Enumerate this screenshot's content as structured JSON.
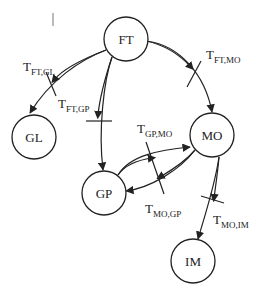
{
  "diagram": {
    "type": "directed-graph",
    "nodes": [
      {
        "id": "FT",
        "label": "FT",
        "cx": 126,
        "cy": 39,
        "r": 22
      },
      {
        "id": "GL",
        "label": "GL",
        "cx": 34,
        "cy": 137,
        "r": 22
      },
      {
        "id": "GP",
        "label": "GP",
        "cx": 104,
        "cy": 193,
        "r": 22
      },
      {
        "id": "MO",
        "label": "MO",
        "cx": 212,
        "cy": 135,
        "r": 22
      },
      {
        "id": "IM",
        "label": "IM",
        "cx": 193,
        "cy": 261,
        "r": 22
      }
    ],
    "edges": [
      {
        "from": "FT",
        "to": "GL",
        "label_main": "T",
        "label_sub": "FT,GL"
      },
      {
        "from": "FT",
        "to": "GP",
        "label_main": "T",
        "label_sub": "FT,GP"
      },
      {
        "from": "FT",
        "to": "MO",
        "label_main": "T",
        "label_sub": "FT,MO"
      },
      {
        "from": "GP",
        "to": "MO",
        "label_main": "T",
        "label_sub": "GP,MO"
      },
      {
        "from": "MO",
        "to": "GP",
        "label_main": "T",
        "label_sub": "MO,GP"
      },
      {
        "from": "MO",
        "to": "IM",
        "label_main": "T",
        "label_sub": "MO,IM"
      }
    ]
  }
}
